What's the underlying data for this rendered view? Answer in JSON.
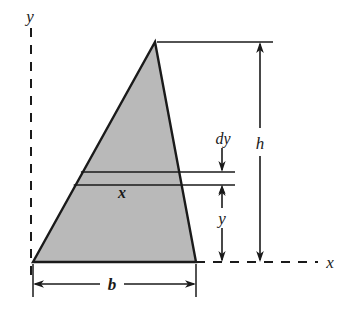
{
  "figure": {
    "background_color": "#ffffff",
    "stroke_color": "#1a1a1a",
    "fill_color": "#b9b9b9",
    "labels": {
      "y_axis": "y",
      "x_axis": "x",
      "height": "h",
      "base": "b",
      "strip_width": "x",
      "strip_thickness": "dy",
      "strip_height": "y"
    },
    "geometry": {
      "apex": [
        155,
        42
      ],
      "base_left": [
        33,
        262
      ],
      "base_right": [
        196,
        262
      ],
      "strip_top_y": 172,
      "strip_bottom_y": 185,
      "axis_origin_x": 31,
      "axis_baseline_y": 262
    }
  }
}
